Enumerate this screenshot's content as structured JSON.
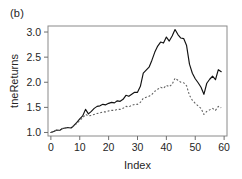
{
  "figure": {
    "panel_label": "(b)"
  },
  "chart_data": {
    "type": "line",
    "title": "",
    "subtitle": "",
    "xlabel": "Index",
    "ylabel": "tneReturns",
    "xlim": [
      -1,
      61
    ],
    "ylim": [
      0.93,
      3.12
    ],
    "xticks": [
      0,
      10,
      20,
      30,
      40,
      50,
      60
    ],
    "xtick_labels": [
      "0",
      "10",
      "20",
      "30",
      "40",
      "50",
      "60"
    ],
    "yticks": [
      1.0,
      1.5,
      2.0,
      2.5,
      3.0
    ],
    "ytick_labels": [
      "1.0",
      "1.5",
      "2.0",
      "2.5",
      "3.0"
    ],
    "grid": false,
    "legend": false,
    "legend_position": "none",
    "annotations": [],
    "x": [
      0,
      1,
      2,
      3,
      4,
      5,
      6,
      7,
      8,
      9,
      10,
      11,
      12,
      13,
      14,
      15,
      16,
      17,
      18,
      19,
      20,
      21,
      22,
      23,
      24,
      25,
      26,
      27,
      28,
      29,
      30,
      31,
      32,
      33,
      34,
      35,
      36,
      37,
      38,
      39,
      40,
      41,
      42,
      43,
      44,
      45,
      46,
      47,
      48,
      49,
      50,
      51,
      52,
      53,
      54,
      55,
      56,
      57,
      58,
      59
    ],
    "series": [
      {
        "name": "solid",
        "style": "solid",
        "color": "#111111",
        "values": [
          1.0,
          1.02,
          1.05,
          1.04,
          1.08,
          1.09,
          1.1,
          1.09,
          1.14,
          1.2,
          1.27,
          1.33,
          1.46,
          1.37,
          1.42,
          1.48,
          1.52,
          1.53,
          1.56,
          1.55,
          1.58,
          1.6,
          1.59,
          1.63,
          1.62,
          1.66,
          1.74,
          1.72,
          1.76,
          1.8,
          1.8,
          1.92,
          2.18,
          2.24,
          2.3,
          2.44,
          2.6,
          2.72,
          2.8,
          2.78,
          2.9,
          2.82,
          2.92,
          3.05,
          2.95,
          2.88,
          2.87,
          2.73,
          2.36,
          2.18,
          2.07,
          1.99,
          1.9,
          1.76,
          1.98,
          2.06,
          2.12,
          2.05,
          2.25,
          2.21
        ]
      },
      {
        "name": "dashed",
        "style": "dashed",
        "color": "#5e5e5e",
        "values": [
          1.0,
          1.02,
          1.05,
          1.04,
          1.08,
          1.09,
          1.1,
          1.09,
          1.13,
          1.18,
          1.24,
          1.29,
          1.36,
          1.33,
          1.34,
          1.36,
          1.38,
          1.39,
          1.41,
          1.41,
          1.43,
          1.44,
          1.44,
          1.46,
          1.46,
          1.48,
          1.52,
          1.51,
          1.54,
          1.56,
          1.56,
          1.6,
          1.68,
          1.7,
          1.72,
          1.76,
          1.82,
          1.86,
          1.9,
          1.88,
          1.94,
          1.91,
          1.96,
          2.08,
          2.04,
          2.0,
          1.99,
          1.93,
          1.74,
          1.64,
          1.58,
          1.53,
          1.48,
          1.36,
          1.42,
          1.45,
          1.48,
          1.44,
          1.52,
          1.49
        ]
      }
    ]
  }
}
